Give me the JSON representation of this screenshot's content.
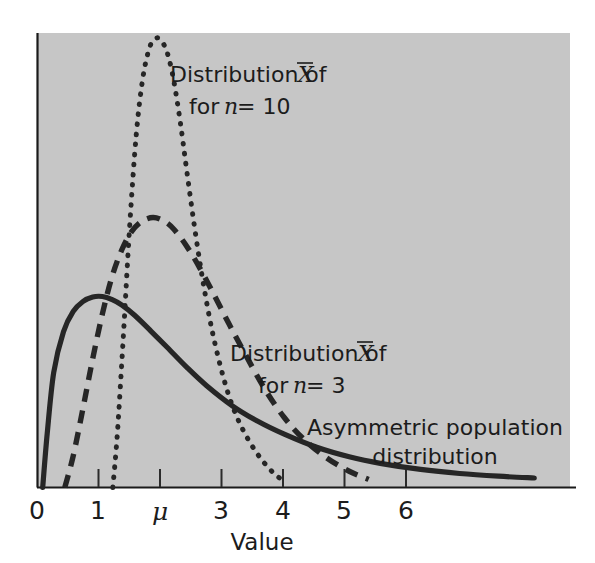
{
  "figure": {
    "background_color": "#c6c6c6",
    "page_color": "#ffffff",
    "ink_color": "#262626"
  },
  "axis": {
    "x_title": "Value",
    "tick_labels": [
      "0",
      "1",
      "μ",
      "3",
      "4",
      "5",
      "6"
    ],
    "tick_values": [
      0,
      1,
      2,
      3,
      4,
      5,
      6
    ],
    "x_range": [
      0,
      8.2
    ],
    "y_range": [
      0,
      1.0
    ],
    "grid": "off"
  },
  "annotations": {
    "dotted": {
      "line1_prefix": "Distribution of ",
      "line1_symbol": "X",
      "line2_prefix": "for ",
      "line2_var": "n",
      "line2_eq": " = 10"
    },
    "dashed": {
      "line1_prefix": "Distribution of ",
      "line1_symbol": "X",
      "line2_prefix": "for ",
      "line2_var": "n",
      "line2_eq": " = 3"
    },
    "solid": {
      "line1": "Asymmetric population",
      "line2": "distribution"
    }
  },
  "chart_data": {
    "type": "line",
    "title": "",
    "xlabel": "Value",
    "ylabel": "",
    "xlim": [
      0,
      8.2
    ],
    "ylim": [
      0,
      1.0
    ],
    "grid": false,
    "legend_position": "inline-annotations",
    "tick_labels": [
      "0",
      "1",
      "μ",
      "3",
      "4",
      "5",
      "6"
    ],
    "tick_values": [
      0,
      1,
      2,
      3,
      4,
      5,
      6
    ],
    "note": "mu is located at x = 2 on the value axis",
    "series": [
      {
        "name": "Asymmetric population distribution",
        "style": "solid",
        "peak_x": 1.0,
        "peak_y": 0.423,
        "x": [
          0.08,
          0.15,
          0.25,
          0.4,
          0.55,
          0.7,
          0.85,
          1.0,
          1.15,
          1.3,
          1.5,
          1.75,
          2.0,
          2.3,
          2.6,
          3.0,
          3.4,
          3.8,
          4.3,
          4.8,
          5.3,
          5.9,
          6.5,
          7.1,
          7.65
        ],
        "y": [
          0.0,
          0.12,
          0.255,
          0.345,
          0.39,
          0.412,
          0.422,
          0.423,
          0.416,
          0.404,
          0.381,
          0.346,
          0.31,
          0.266,
          0.226,
          0.181,
          0.146,
          0.118,
          0.089,
          0.068,
          0.053,
          0.04,
          0.031,
          0.025,
          0.021
        ]
      },
      {
        "name": "Distribution of Xbar for n = 3",
        "style": "dashed",
        "peak_x": 1.78,
        "peak_y": 0.598,
        "x": [
          0.42,
          0.55,
          0.7,
          0.85,
          1.0,
          1.15,
          1.3,
          1.45,
          1.6,
          1.78,
          1.95,
          2.1,
          2.3,
          2.5,
          2.7,
          2.95,
          3.2,
          3.5,
          3.8,
          4.1,
          4.45,
          4.8,
          5.1
        ],
        "y": [
          0.0,
          0.07,
          0.175,
          0.285,
          0.385,
          0.468,
          0.527,
          0.567,
          0.589,
          0.598,
          0.59,
          0.572,
          0.534,
          0.486,
          0.432,
          0.362,
          0.295,
          0.218,
          0.155,
          0.107,
          0.066,
          0.036,
          0.018
        ]
      },
      {
        "name": "Distribution of Xbar for n = 10",
        "style": "dotted",
        "peak_x": 1.87,
        "peak_y": 0.995,
        "x": [
          1.16,
          1.23,
          1.32,
          1.42,
          1.52,
          1.62,
          1.72,
          1.8,
          1.87,
          1.95,
          2.02,
          2.1,
          2.2,
          2.3,
          2.42,
          2.55,
          2.7,
          2.88,
          3.05,
          3.25,
          3.45,
          3.65,
          3.82
        ],
        "y": [
          0.0,
          0.12,
          0.33,
          0.58,
          0.78,
          0.905,
          0.972,
          0.992,
          0.995,
          0.98,
          0.952,
          0.9,
          0.808,
          0.7,
          0.575,
          0.455,
          0.34,
          0.235,
          0.163,
          0.105,
          0.062,
          0.03,
          0.012
        ]
      }
    ]
  }
}
